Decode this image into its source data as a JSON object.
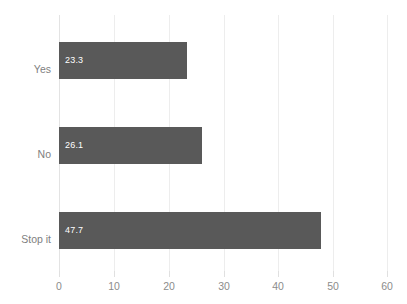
{
  "chart_data": {
    "type": "bar",
    "orientation": "horizontal",
    "title": "",
    "subtitle": "",
    "xlabel": "",
    "ylabel": "",
    "categories": [
      "Yes",
      "No",
      "Stop it"
    ],
    "values": [
      23.3,
      26.1,
      47.7
    ],
    "data_labels": [
      "23.3",
      "26.1",
      "47.7"
    ],
    "xlim": [
      0,
      60
    ],
    "xticks": [
      0,
      10,
      20,
      30,
      40,
      50,
      60
    ],
    "xtick_labels": [
      "0",
      "10",
      "20",
      "30",
      "40",
      "50",
      "60"
    ],
    "grid": true,
    "grid_axis": "x",
    "legend": false,
    "legend_position": "none",
    "series": [
      {
        "name": "",
        "values": [
          23.3,
          26.1,
          47.7
        ]
      }
    ],
    "colors": {
      "bar": "#595959",
      "background": "#ffffff",
      "gridline": "#ededed",
      "zero_line": "#e3e3e3",
      "data_label": "#ffffff",
      "category_label": "#808080",
      "tick_label": "#8c8c8c"
    }
  }
}
